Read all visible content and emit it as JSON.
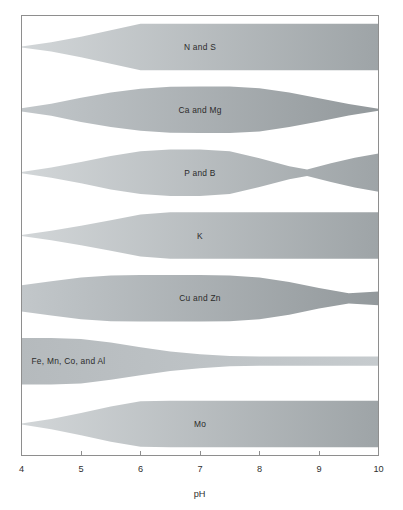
{
  "figure": {
    "background_color": "#ffffff",
    "frame_color": "#8e8e8e",
    "label_text_color": "#2b2b2b"
  },
  "axis": {
    "title": "pH",
    "tick_labels": [
      "4",
      "5",
      "6",
      "7",
      "8",
      "9",
      "10"
    ],
    "ticks": [
      4,
      5,
      6,
      7,
      8,
      9,
      10
    ],
    "min": 4,
    "max": 10
  },
  "bands": [
    {
      "label": "N and S",
      "label_align": "center",
      "fill_light": "#d2d6d8",
      "fill_dark": "#9ea4a7"
    },
    {
      "label": "Ca and Mg",
      "label_align": "center",
      "fill_light": "#c2c7ca",
      "fill_dark": "#93999c"
    },
    {
      "label": "P and B",
      "label_align": "center",
      "fill_light": "#d2d6d8",
      "fill_dark": "#9ea4a7"
    },
    {
      "label": "K",
      "label_align": "center",
      "fill_light": "#d2d6d8",
      "fill_dark": "#9ea4a7"
    },
    {
      "label": "Cu and Zn",
      "label_align": "center",
      "fill_light": "#c2c7ca",
      "fill_dark": "#93999c"
    },
    {
      "label": "Fe, Mn, Co, and Al",
      "label_align": "left",
      "fill_light": "#b5babd",
      "fill_dark": "#c6cbce"
    },
    {
      "label": "Mo",
      "label_align": "center",
      "fill_light": "#d2d6d8",
      "fill_dark": "#9ea4a7"
    }
  ],
  "chart_data": {
    "type": "area",
    "title": "",
    "subtitle": "",
    "xlabel": "pH",
    "ylabel": "",
    "xlim": [
      4,
      10
    ],
    "grid": false,
    "legend": "none",
    "xticks": [
      4,
      5,
      6,
      7,
      8,
      9,
      10
    ],
    "xticklabels": [
      "4",
      "5",
      "6",
      "7",
      "8",
      "9",
      "10"
    ],
    "series": [
      {
        "name": "N and S",
        "x": [
          4.0,
          4.5,
          5.0,
          5.5,
          6.0,
          6.5,
          7.0,
          7.5,
          8.0,
          8.5,
          9.0,
          9.5,
          10.0
        ],
        "width": [
          0.02,
          0.2,
          0.44,
          0.72,
          1.0,
          1.0,
          1.0,
          1.0,
          1.0,
          1.0,
          1.0,
          1.0,
          1.0
        ]
      },
      {
        "name": "Ca and Mg",
        "x": [
          4.0,
          4.5,
          5.0,
          5.5,
          6.0,
          6.5,
          7.0,
          7.5,
          8.0,
          8.5,
          9.0,
          9.5,
          10.0
        ],
        "width": [
          0.07,
          0.26,
          0.52,
          0.74,
          0.9,
          0.99,
          1.0,
          1.0,
          0.93,
          0.74,
          0.5,
          0.25,
          0.04
        ]
      },
      {
        "name": "P and B",
        "x": [
          4.0,
          4.5,
          5.0,
          5.5,
          6.0,
          6.5,
          7.0,
          7.5,
          8.0,
          8.5,
          8.8,
          9.2,
          9.6,
          10.0
        ],
        "width": [
          0.03,
          0.22,
          0.46,
          0.72,
          0.92,
          1.0,
          1.0,
          0.92,
          0.62,
          0.28,
          0.14,
          0.4,
          0.64,
          0.82
        ]
      },
      {
        "name": "K",
        "x": [
          4.0,
          4.5,
          5.0,
          5.5,
          6.0,
          6.5,
          7.0,
          7.5,
          8.0,
          8.5,
          9.0,
          9.5,
          10.0
        ],
        "width": [
          0.02,
          0.2,
          0.42,
          0.66,
          0.9,
          1.0,
          1.0,
          1.0,
          1.0,
          1.0,
          1.0,
          1.0,
          1.0
        ]
      },
      {
        "name": "Cu and Zn",
        "x": [
          4.0,
          4.5,
          5.0,
          5.5,
          6.0,
          6.5,
          7.0,
          7.5,
          8.0,
          8.5,
          9.0,
          9.5,
          10.0
        ],
        "width": [
          0.56,
          0.74,
          0.9,
          0.98,
          1.0,
          1.0,
          1.0,
          0.98,
          0.9,
          0.7,
          0.44,
          0.22,
          0.3
        ]
      },
      {
        "name": "Fe, Mn, Co, and Al",
        "x": [
          4.0,
          4.5,
          5.0,
          5.5,
          6.0,
          6.5,
          7.0,
          7.5,
          8.0,
          8.5,
          9.0,
          9.5,
          10.0
        ],
        "width": [
          1.0,
          1.0,
          0.96,
          0.8,
          0.6,
          0.42,
          0.3,
          0.22,
          0.2,
          0.2,
          0.2,
          0.2,
          0.2
        ]
      },
      {
        "name": "Mo",
        "x": [
          4.0,
          4.5,
          5.0,
          5.5,
          6.0,
          6.5,
          7.0,
          7.5,
          8.0,
          8.5,
          9.0,
          9.5,
          10.0
        ],
        "width": [
          0.02,
          0.22,
          0.48,
          0.76,
          0.98,
          1.0,
          1.0,
          1.0,
          1.0,
          1.0,
          1.0,
          1.0,
          1.0
        ]
      }
    ]
  }
}
